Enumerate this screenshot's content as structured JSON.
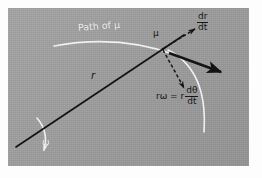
{
  "figure": {
    "background_color": "#ffffff",
    "panel_color": "#9d9d9d",
    "ink_color": "#151515",
    "highlight_color": "#f2f2f2"
  },
  "labels": {
    "path": "Path of μ",
    "particle": "μ",
    "radius": "r",
    "angular_velocity": "ω",
    "radial_velocity_numerator": "dr",
    "radial_velocity_denominator": "dt",
    "tangential_lead": "rω = r",
    "tangential_numerator": "dθ",
    "tangential_denominator": "dt"
  },
  "elements": {
    "radius_line": "radius-line",
    "path_arc": "path-arc",
    "omega_arc": "omega-arc",
    "sweep_arc": "sweep-arc",
    "radial_arrow": "radial-velocity-arrow",
    "tangential_arrow": "tangential-velocity-arrow",
    "resultant_arrow": "resultant-velocity-arrow",
    "particle_dot": "particle-marker"
  }
}
